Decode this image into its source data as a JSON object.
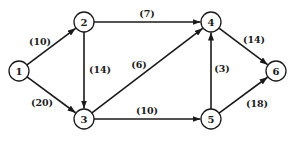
{
  "diagram": {
    "type": "directed-weighted-graph",
    "nodes": [
      {
        "id": "1",
        "label": "1",
        "x": 19,
        "y": 71
      },
      {
        "id": "2",
        "label": "2",
        "x": 84,
        "y": 22
      },
      {
        "id": "3",
        "label": "3",
        "x": 84,
        "y": 119
      },
      {
        "id": "4",
        "label": "4",
        "x": 211,
        "y": 22
      },
      {
        "id": "5",
        "label": "5",
        "x": 211,
        "y": 119
      },
      {
        "id": "6",
        "label": "6",
        "x": 276,
        "y": 71
      }
    ],
    "edges": [
      {
        "from": "1",
        "to": "2",
        "label": "(10)",
        "lx": 40,
        "ly": 41
      },
      {
        "from": "1",
        "to": "3",
        "label": "(20)",
        "lx": 42,
        "ly": 102
      },
      {
        "from": "2",
        "to": "3",
        "label": "(14)",
        "lx": 100,
        "ly": 69
      },
      {
        "from": "2",
        "to": "4",
        "label": "(7)",
        "lx": 147,
        "ly": 13
      },
      {
        "from": "3",
        "to": "4",
        "label": "(6)",
        "lx": 139,
        "ly": 64
      },
      {
        "from": "3",
        "to": "5",
        "label": "(10)",
        "lx": 147,
        "ly": 110
      },
      {
        "from": "5",
        "to": "4",
        "label": "(3)",
        "lx": 222,
        "ly": 68
      },
      {
        "from": "4",
        "to": "6",
        "label": "(14)",
        "lx": 254,
        "ly": 39
      },
      {
        "from": "5",
        "to": "6",
        "label": "(18)",
        "lx": 257,
        "ly": 103
      }
    ],
    "node_radius": 10
  }
}
